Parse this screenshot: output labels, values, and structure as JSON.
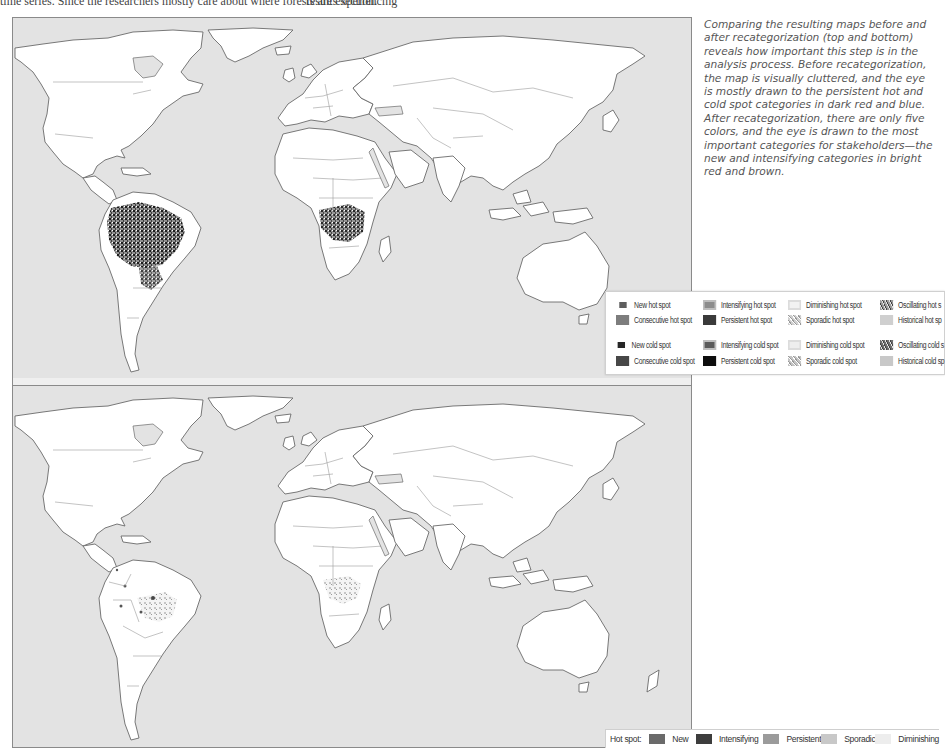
{
  "page": {
    "overflow_text_left": "time series. Since the researchers mostly care about where forests are experiencing",
    "overflow_text_right": "results section."
  },
  "caption": {
    "text": "Comparing the resulting maps before and after recategorization (top and bottom) reveals how important this step is in the analysis process. Before recategorization, the map is visually cluttered, and the eye is mostly drawn to the persistent hot and cold spot categories in dark red and blue. After recategorization, there are only five colors, and the eye is drawn to the most important categories for stakeholders—the new and intensifying categories in bright red and brown."
  },
  "maps": {
    "top": {
      "label": "Before recategorization",
      "ocean_color": "#e3e3e3",
      "land_color": "#ffffff"
    },
    "bottom": {
      "label": "After recategorization",
      "ocean_color": "#e3e3e3",
      "land_color": "#ffffff"
    }
  },
  "legend_top": {
    "items": [
      {
        "label": "New hot spot",
        "swatch": "#5e5e5e",
        "size": "small"
      },
      {
        "label": "Consecutive hot spot",
        "swatch": "#7d7d7d",
        "size": "big"
      },
      {
        "label": "Intensifying hot spot",
        "swatch": "#8c8c8c",
        "size": "big",
        "pattern": "glow"
      },
      {
        "label": "Persistent hot spot",
        "swatch": "#3a3a3a",
        "size": "big"
      },
      {
        "label": "Diminishing hot spot",
        "swatch": "#f2f2f2",
        "size": "big",
        "pattern": "glow-light"
      },
      {
        "label": "Sporadic hot spot",
        "swatch": "#d0d0d0",
        "size": "big",
        "pattern": "speckle"
      },
      {
        "label": "Oscillating hot s",
        "swatch": "#9a9a9a",
        "size": "big",
        "pattern": "mottle"
      },
      {
        "label": "Historical hot sp",
        "swatch": "#cfcfcf",
        "size": "big"
      },
      {
        "label": "New cold spot",
        "swatch": "#262626",
        "size": "small"
      },
      {
        "label": "Consecutive cold spot",
        "swatch": "#474747",
        "size": "big"
      },
      {
        "label": "Intensifying cold spot",
        "swatch": "#5a5a5a",
        "size": "big",
        "pattern": "glow"
      },
      {
        "label": "Persistent cold spot",
        "swatch": "#0d0d0d",
        "size": "big"
      },
      {
        "label": "Diminishing cold spot",
        "swatch": "#eeeeee",
        "size": "big",
        "pattern": "glow-light"
      },
      {
        "label": "Sporadic cold spot",
        "swatch": "#c4c4c4",
        "size": "big",
        "pattern": "speckle"
      },
      {
        "label": "Oscillating cold s",
        "swatch": "#6e6e6e",
        "size": "big",
        "pattern": "mottle"
      },
      {
        "label": "Historical cold sp",
        "swatch": "#c8c8c8",
        "size": "big"
      }
    ]
  },
  "legend_bottom": {
    "title": "Hot spot:",
    "items": [
      {
        "label": "New",
        "swatch": "#6a6a6a"
      },
      {
        "label": "Intensifying",
        "swatch": "#3d3d3d"
      },
      {
        "label": "Persistent",
        "swatch": "#9b9b9b"
      },
      {
        "label": "Sporadic",
        "swatch": "#c8c8c8"
      },
      {
        "label": "Diminishing",
        "swatch": "#ededed"
      }
    ]
  }
}
